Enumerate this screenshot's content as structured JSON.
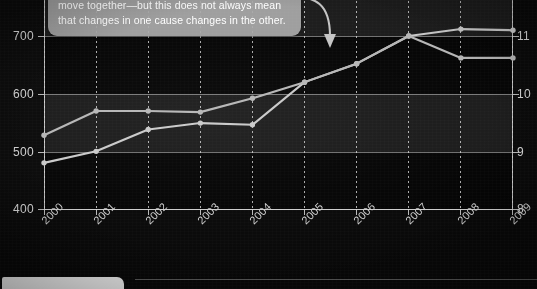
{
  "callout": {
    "text": "Two variables may be closely correlated—they move together—but this does not always mean that changes in one cause changes in the other.",
    "arrow_name": "curved-arrow-to-2006-point",
    "background_color": "#a8a8a8",
    "text_color": "#ffffff"
  },
  "chart_data": {
    "type": "line",
    "title": "",
    "xlabel": "",
    "ylabel": "",
    "grid": true,
    "legend": "none",
    "categories": [
      "2000",
      "2001",
      "2002",
      "2003",
      "2004",
      "2005",
      "2006",
      "2007",
      "2008",
      "2009"
    ],
    "x_tick_labels": [
      "2000",
      "2001",
      "2002",
      "2003",
      "2004",
      "2005",
      "2006",
      "2007",
      "2008",
      "2009"
    ],
    "left_axis": {
      "ylim": [
        400,
        700
      ],
      "ticks": [
        400,
        500,
        600,
        700
      ],
      "tick_labels": [
        "400",
        "500",
        "600",
        "700"
      ]
    },
    "right_axis": {
      "ylim": [
        8,
        11
      ],
      "ticks": [
        8,
        9,
        10,
        11
      ],
      "tick_labels": [
        "8",
        "9",
        "10",
        "11"
      ]
    },
    "series": [
      {
        "name": "series-left-axis",
        "axis": "left",
        "color": "#c9c9c9",
        "values": [
          480,
          500,
          538,
          549,
          546,
          620,
          652,
          700,
          712,
          710
        ]
      },
      {
        "name": "series-right-axis",
        "axis": "right",
        "color": "#b5b5b5",
        "values": [
          9.28,
          9.7,
          9.7,
          9.68,
          9.92,
          10.2,
          10.52,
          11.0,
          10.62,
          10.62
        ]
      }
    ],
    "bands": [
      {
        "from": 500,
        "to": 600,
        "shade": "light"
      },
      {
        "from": 700,
        "to": 760,
        "shade": "light"
      }
    ]
  },
  "footer": {
    "tab_name": "page-tab",
    "tab_color": "#e9e9e9"
  }
}
